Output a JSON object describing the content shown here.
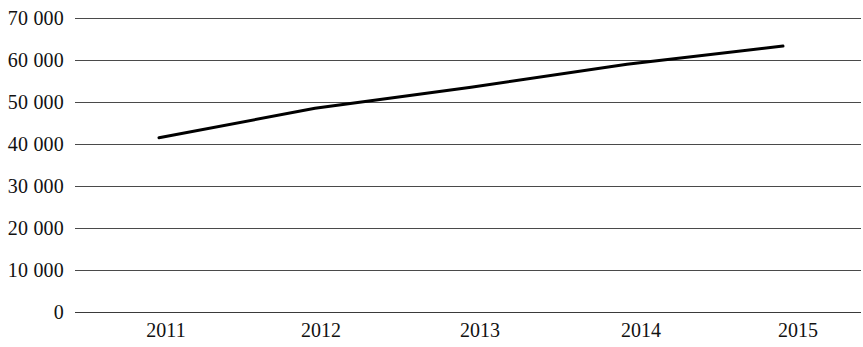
{
  "chart_data": {
    "type": "line",
    "title": "",
    "subtitle": "",
    "xlabel": "",
    "ylabel": "",
    "categories": [
      "2011",
      "2012",
      "2013",
      "2014",
      "2015"
    ],
    "x": [
      2011,
      2012,
      2013,
      2014,
      2015
    ],
    "series": [
      {
        "name": "",
        "values": [
          41500,
          48500,
          53500,
          59000,
          63300
        ],
        "color": "#000000",
        "line_width": 3,
        "markers": false
      }
    ],
    "ylim": [
      0,
      70000
    ],
    "ytick_values": [
      70000,
      60000,
      50000,
      40000,
      30000,
      20000,
      10000,
      0
    ],
    "ytick_labels": [
      "70 000",
      "60 000",
      "50 000",
      "40 000",
      "30 000",
      "20 000",
      "10 000",
      "0"
    ],
    "xtick_labels": [
      "2011",
      "2012",
      "2013",
      "2014",
      "2015"
    ],
    "grid": {
      "horizontal": true,
      "vertical": false,
      "color": "#4a4a4a"
    },
    "legend": {
      "visible": false,
      "position": "none",
      "entries": []
    },
    "axis": {
      "y_axis_line": false,
      "x_axis_line": true,
      "background": "#ffffff"
    },
    "geometry": {
      "plot_left": 75,
      "plot_right": 861,
      "y_top_value_px": 18,
      "y_zero_px": 312,
      "px_per_10000": 42,
      "point_x_px": [
        159,
        315,
        471,
        627,
        783
      ]
    }
  }
}
